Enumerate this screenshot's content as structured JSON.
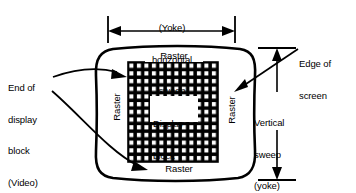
{
  "diagram": {
    "colors": {
      "ink": "#000000",
      "paper": "#ffffff"
    },
    "labels": {
      "horizontal_sweep": {
        "line1": "(Yoke)",
        "line2": "horizontal",
        "line3": "sweep"
      },
      "vertical_sweep": {
        "line1": "Vertical",
        "line2": "sweep",
        "line3": "(yoke)"
      },
      "edge_of_screen": {
        "line1": "Edge of",
        "line2": "screen"
      },
      "end_of_display_block": {
        "line1": "End of",
        "line2": "display",
        "line3": "block",
        "line4": "(Video)"
      },
      "display_block": {
        "line1": "Display",
        "line2": "block"
      },
      "raster_top": "Raster",
      "raster_bottom": "Raster",
      "raster_left": "Raster",
      "raster_right": "Raster"
    },
    "grid": {
      "columns": 12,
      "rows": 13
    }
  }
}
